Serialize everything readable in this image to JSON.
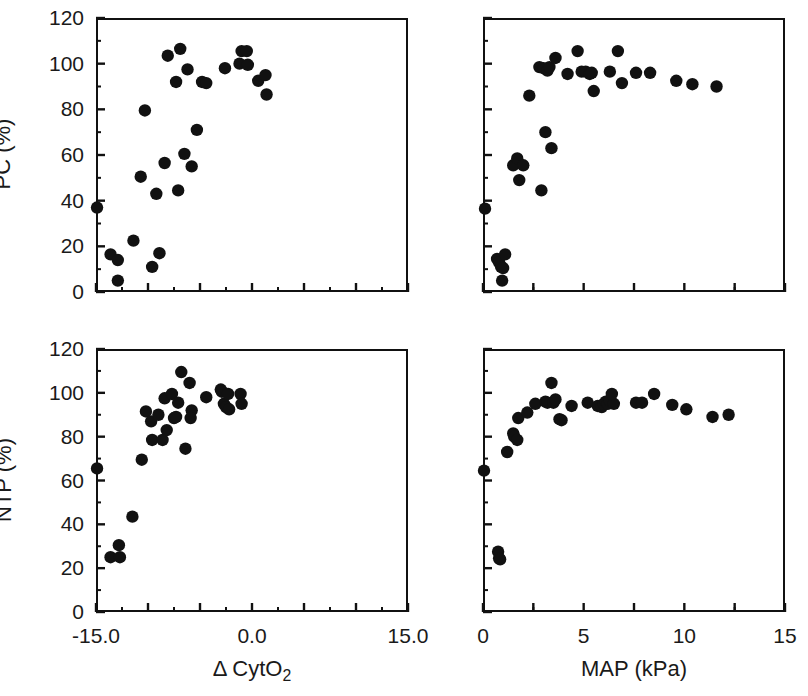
{
  "figure": {
    "background": "#ffffff",
    "marker_color": "#111111",
    "axis_color": "#111111"
  },
  "chart_data": [
    {
      "id": "pc-vs-dcyto2",
      "type": "scatter",
      "title": "",
      "xlabel": "Δ CytO2",
      "ylabel": "PC (%)",
      "xlim": [
        -15.0,
        15.0
      ],
      "ylim": [
        0,
        120
      ],
      "xticks": [
        -15.0,
        -10.0,
        -5.0,
        0.0,
        5.0,
        10.0,
        15.0
      ],
      "xticklabels": [
        "-15.0",
        "",
        "",
        "0.0",
        "",
        "",
        "15.0"
      ],
      "yticks": [
        0,
        20,
        40,
        60,
        80,
        100,
        120
      ],
      "yticklabels": [
        "0",
        "20",
        "40",
        "60",
        "80",
        "100",
        "120"
      ],
      "minor_xticks": [
        -12.5,
        -7.5,
        -2.5,
        2.5,
        7.5,
        12.5
      ],
      "minor_yticks": [
        10,
        30,
        50,
        70,
        90,
        110
      ],
      "grid": false,
      "legend": null,
      "points": [
        [
          -14.9,
          37.0
        ],
        [
          -13.6,
          16.5
        ],
        [
          -12.9,
          14.0
        ],
        [
          -12.9,
          5.0
        ],
        [
          -11.4,
          22.5
        ],
        [
          -10.7,
          50.5
        ],
        [
          -10.3,
          79.5
        ],
        [
          -9.6,
          11.0
        ],
        [
          -9.2,
          43.0
        ],
        [
          -8.9,
          17.0
        ],
        [
          -8.4,
          56.5
        ],
        [
          -8.1,
          103.5
        ],
        [
          -7.3,
          92.0
        ],
        [
          -7.1,
          44.5
        ],
        [
          -6.9,
          106.5
        ],
        [
          -6.5,
          60.5
        ],
        [
          -6.2,
          97.5
        ],
        [
          -5.8,
          55.0
        ],
        [
          -5.3,
          71.0
        ],
        [
          -4.8,
          92.0
        ],
        [
          -4.4,
          91.5
        ],
        [
          -2.6,
          98.0
        ],
        [
          -1.2,
          100.0
        ],
        [
          -1.0,
          105.5
        ],
        [
          -0.5,
          105.5
        ],
        [
          -0.4,
          99.5
        ],
        [
          0.6,
          92.5
        ],
        [
          1.3,
          95.0
        ],
        [
          1.4,
          86.5
        ]
      ]
    },
    {
      "id": "pc-vs-map",
      "type": "scatter",
      "title": "",
      "xlabel": "MAP (kPa)",
      "ylabel": "PC (%)",
      "xlim": [
        0,
        15
      ],
      "ylim": [
        0,
        120
      ],
      "xticks": [
        0,
        2.5,
        5,
        7.5,
        10,
        12.5,
        15
      ],
      "xticklabels": [
        "0",
        "",
        "5",
        "",
        "10",
        "",
        "15"
      ],
      "yticks": [
        0,
        20,
        40,
        60,
        80,
        100,
        120
      ],
      "yticklabels": [
        "",
        "",
        "",
        "",
        "",
        "",
        ""
      ],
      "minor_xticks": [
        2.5,
        7.5,
        12.5
      ],
      "minor_yticks": [
        10,
        30,
        50,
        70,
        90,
        110
      ],
      "grid": false,
      "legend": null,
      "points": [
        [
          0.1,
          36.5
        ],
        [
          0.7,
          14.5
        ],
        [
          0.8,
          13.0
        ],
        [
          0.9,
          11.0
        ],
        [
          1.0,
          10.5
        ],
        [
          1.1,
          16.5
        ],
        [
          0.95,
          5.0
        ],
        [
          1.5,
          55.5
        ],
        [
          1.7,
          58.5
        ],
        [
          2.0,
          55.5
        ],
        [
          1.8,
          49.0
        ],
        [
          2.3,
          86.0
        ],
        [
          2.8,
          98.5
        ],
        [
          3.0,
          98.0
        ],
        [
          3.2,
          97.0
        ],
        [
          3.3,
          98.5
        ],
        [
          3.6,
          102.5
        ],
        [
          3.1,
          70.0
        ],
        [
          3.4,
          63.0
        ],
        [
          2.9,
          44.5
        ],
        [
          4.2,
          95.5
        ],
        [
          4.7,
          105.5
        ],
        [
          4.9,
          96.5
        ],
        [
          5.1,
          96.5
        ],
        [
          5.3,
          95.5
        ],
        [
          5.4,
          96.0
        ],
        [
          5.5,
          88.0
        ],
        [
          6.3,
          96.5
        ],
        [
          6.7,
          105.5
        ],
        [
          6.9,
          91.5
        ],
        [
          7.6,
          96.0
        ],
        [
          8.3,
          96.0
        ],
        [
          9.6,
          92.5
        ],
        [
          10.4,
          91.0
        ],
        [
          11.6,
          90.0
        ]
      ]
    },
    {
      "id": "ntp-vs-dcyto2",
      "type": "scatter",
      "title": "",
      "xlabel": "Δ CytO2",
      "ylabel": "NTP (%)",
      "xlim": [
        -15.0,
        15.0
      ],
      "ylim": [
        0,
        120
      ],
      "xticks": [
        -15.0,
        -10.0,
        -5.0,
        0.0,
        5.0,
        10.0,
        15.0
      ],
      "xticklabels": [
        "-15.0",
        "",
        "",
        "0.0",
        "",
        "",
        "15.0"
      ],
      "yticks": [
        0,
        20,
        40,
        60,
        80,
        100,
        120
      ],
      "yticklabels": [
        "0",
        "20",
        "40",
        "60",
        "80",
        "100",
        "120"
      ],
      "minor_xticks": [
        -12.5,
        -7.5,
        -2.5,
        2.5,
        7.5,
        12.5
      ],
      "minor_yticks": [
        10,
        30,
        50,
        70,
        90,
        110
      ],
      "grid": false,
      "legend": null,
      "points": [
        [
          -14.9,
          65.5
        ],
        [
          -13.6,
          25.0
        ],
        [
          -12.8,
          30.5
        ],
        [
          -12.7,
          25.0
        ],
        [
          -11.5,
          43.5
        ],
        [
          -10.6,
          69.5
        ],
        [
          -10.2,
          91.5
        ],
        [
          -9.7,
          87.0
        ],
        [
          -9.6,
          78.5
        ],
        [
          -9.0,
          90.0
        ],
        [
          -8.6,
          78.5
        ],
        [
          -8.4,
          97.5
        ],
        [
          -8.2,
          83.0
        ],
        [
          -7.7,
          99.5
        ],
        [
          -7.5,
          88.5
        ],
        [
          -7.3,
          89.0
        ],
        [
          -7.1,
          95.5
        ],
        [
          -6.8,
          109.5
        ],
        [
          -6.4,
          74.5
        ],
        [
          -6.0,
          104.5
        ],
        [
          -5.8,
          92.0
        ],
        [
          -5.9,
          88.5
        ],
        [
          -4.4,
          98.0
        ],
        [
          -3.0,
          101.5
        ],
        [
          -2.9,
          100.5
        ],
        [
          -2.7,
          95.0
        ],
        [
          -2.5,
          93.5
        ],
        [
          -2.3,
          99.5
        ],
        [
          -2.2,
          92.5
        ],
        [
          -1.1,
          99.5
        ],
        [
          -1.0,
          95.0
        ]
      ]
    },
    {
      "id": "ntp-vs-map",
      "type": "scatter",
      "title": "",
      "xlabel": "MAP (kPa)",
      "ylabel": "NTP (%)",
      "xlim": [
        0,
        15
      ],
      "ylim": [
        0,
        120
      ],
      "xticks": [
        0,
        2.5,
        5,
        7.5,
        10,
        12.5,
        15
      ],
      "xticklabels": [
        "0",
        "",
        "5",
        "",
        "10",
        "",
        "15"
      ],
      "yticks": [
        0,
        20,
        40,
        60,
        80,
        100,
        120
      ],
      "yticklabels": [
        "",
        "",
        "",
        "",
        "",
        "",
        ""
      ],
      "minor_xticks": [
        2.5,
        7.5,
        12.5
      ],
      "minor_yticks": [
        10,
        30,
        50,
        70,
        90,
        110
      ],
      "grid": false,
      "legend": null,
      "points": [
        [
          0.05,
          64.5
        ],
        [
          0.75,
          27.5
        ],
        [
          0.8,
          24.5
        ],
        [
          0.85,
          24.0
        ],
        [
          1.2,
          73.0
        ],
        [
          1.5,
          81.5
        ],
        [
          1.55,
          80.0
        ],
        [
          1.7,
          78.5
        ],
        [
          1.75,
          88.5
        ],
        [
          2.2,
          91.0
        ],
        [
          2.6,
          95.0
        ],
        [
          3.1,
          96.0
        ],
        [
          3.2,
          95.5
        ],
        [
          3.4,
          104.5
        ],
        [
          3.5,
          95.5
        ],
        [
          3.6,
          97.0
        ],
        [
          3.8,
          88.0
        ],
        [
          3.9,
          87.5
        ],
        [
          4.4,
          94.0
        ],
        [
          5.2,
          95.5
        ],
        [
          5.7,
          94.0
        ],
        [
          5.9,
          93.5
        ],
        [
          6.0,
          95.0
        ],
        [
          6.1,
          96.0
        ],
        [
          6.2,
          95.0
        ],
        [
          6.3,
          96.5
        ],
        [
          6.5,
          95.0
        ],
        [
          6.4,
          99.5
        ],
        [
          7.6,
          95.5
        ],
        [
          7.9,
          95.5
        ],
        [
          8.5,
          99.5
        ],
        [
          9.4,
          94.5
        ],
        [
          10.1,
          92.5
        ],
        [
          11.4,
          89.0
        ],
        [
          12.2,
          90.0
        ]
      ]
    }
  ]
}
